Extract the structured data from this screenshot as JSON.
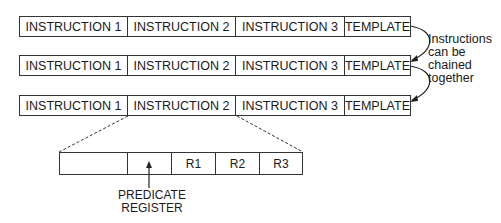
{
  "rows": [
    {
      "cells": [
        "INSTRUCTION 1",
        "INSTRUCTION 2",
        "INSTRUCTION 3",
        "TEMPLATE"
      ]
    },
    {
      "cells": [
        "INSTRUCTION 1",
        "INSTRUCTION 2",
        "INSTRUCTION 3",
        "TEMPLATE"
      ]
    },
    {
      "cells": [
        "INSTRUCTION 1",
        "INSTRUCTION 2",
        "INSTRUCTION 3",
        "TEMPLATE"
      ]
    }
  ],
  "chain_note": {
    "lines": [
      "Instructions",
      "can be",
      "chained",
      "together"
    ]
  },
  "instruction_detail": {
    "fields": [
      "",
      "",
      "R1",
      "R2",
      "R3"
    ]
  },
  "predicate_label": {
    "lines": [
      "PREDICATE",
      "REGISTER"
    ]
  }
}
